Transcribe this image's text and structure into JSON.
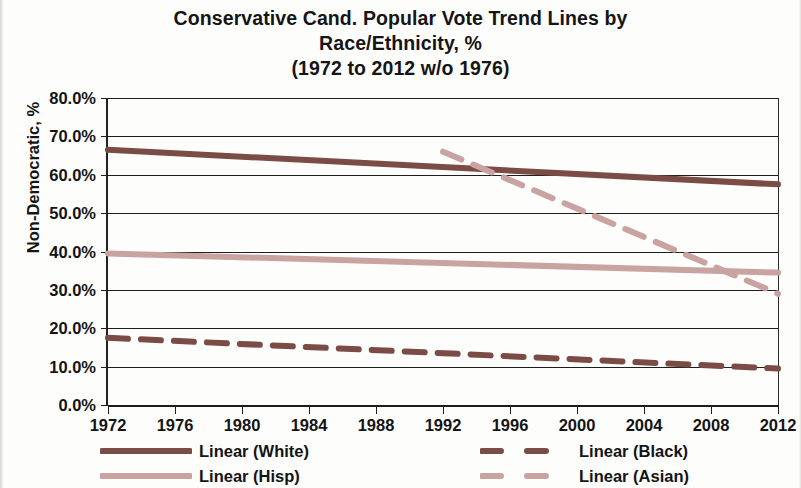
{
  "chart_data": {
    "type": "line",
    "title": "Conservative Cand. Popular Vote Trend Lines by Race/Ethnicity, % (1972 to 2012 w/o 1976)",
    "title_lines": [
      "Conservative Cand. Popular Vote Trend Lines by",
      "Race/Ethnicity, %",
      "(1972 to 2012 w/o 1976)"
    ],
    "xlabel": "",
    "ylabel": "Non-Democratic, %",
    "xlim": [
      1972,
      2012
    ],
    "ylim": [
      0,
      80
    ],
    "grid": true,
    "legend_position": "bottom",
    "x_ticks": [
      1972,
      1976,
      1980,
      1984,
      1988,
      1992,
      1996,
      2000,
      2004,
      2008,
      2012
    ],
    "x_tick_labels": [
      "1972",
      "1976",
      "1980",
      "1984",
      "1988",
      "1992",
      "1996",
      "2000",
      "2004",
      "2008",
      "2012"
    ],
    "y_ticks": [
      0,
      10,
      20,
      30,
      40,
      50,
      60,
      70,
      80
    ],
    "y_tick_labels": [
      "0.0%",
      "10.0%",
      "20.0%",
      "30.0%",
      "40.0%",
      "50.0%",
      "60.0%",
      "70.0%",
      "80.0%"
    ],
    "series": [
      {
        "name": "Linear (White)",
        "style": "solid",
        "color": "#7b4c46",
        "width": 6,
        "x": [
          1972,
          2012
        ],
        "values": [
          66.5,
          57.5
        ]
      },
      {
        "name": "Linear (Black)",
        "style": "dashed",
        "color": "#7b4c46",
        "width": 6,
        "x": [
          1972,
          2012
        ],
        "values": [
          17.5,
          9.5
        ]
      },
      {
        "name": "Linear (Hisp)",
        "style": "solid",
        "color": "#c9a3a0",
        "width": 6,
        "x": [
          1972,
          2012
        ],
        "values": [
          39.5,
          34.5
        ]
      },
      {
        "name": "Linear (Asian)",
        "style": "dashed",
        "color": "#c9a3a0",
        "width": 6,
        "x": [
          1992,
          2012
        ],
        "values": [
          66.0,
          29.0
        ]
      }
    ]
  },
  "legend": {
    "items": [
      {
        "label": "Linear (White)",
        "color": "#7b4c46",
        "style": "solid"
      },
      {
        "label": "Linear (Hisp)",
        "color": "#c9a3a0",
        "style": "solid"
      },
      {
        "label": "Linear (Black)",
        "color": "#7b4c46",
        "style": "dashed"
      },
      {
        "label": "Linear (Asian)",
        "color": "#c9a3a0",
        "style": "dashed"
      }
    ]
  }
}
